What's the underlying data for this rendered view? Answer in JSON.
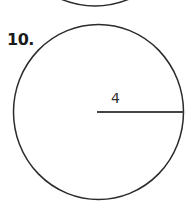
{
  "previous_problem": {
    "shape": "circle-arc-bottom",
    "visible": "partial"
  },
  "problem": {
    "number_label": "10.",
    "figure": {
      "shape": "circle",
      "radius_label": "4",
      "segment": "radius",
      "stroke_color": "#2b2b2b",
      "radius_line_color": "#444444"
    }
  }
}
